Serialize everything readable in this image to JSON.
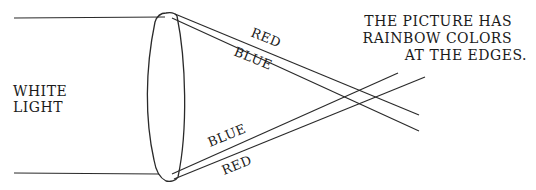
{
  "diagram": {
    "input_label": {
      "line1": "WHITE",
      "line2": "LIGHT"
    },
    "caption": {
      "line1": "THE PICTURE HAS",
      "line2": "RAINBOW COLORS",
      "line3": "AT THE EDGES."
    },
    "top_rays": {
      "red_label": "RED",
      "blue_label": "BLUE"
    },
    "bottom_rays": {
      "blue_label": "BLUE",
      "red_label": "RED"
    },
    "colors": {
      "line": "#2a2a2a",
      "text": "#1a1a1a",
      "background": "#ffffff"
    }
  }
}
